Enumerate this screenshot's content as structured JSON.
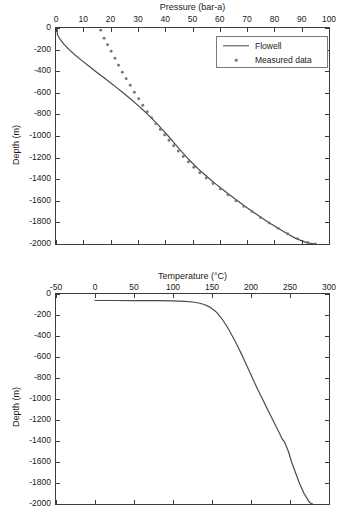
{
  "figure": {
    "width": 344,
    "height": 523,
    "background": "#ffffff",
    "line_color": "#4a4a4a",
    "marker_color": "#777777",
    "axis_color": "#3c3c3c"
  },
  "legend": {
    "entries": [
      {
        "label": "Flowell",
        "style": "line",
        "icon": "line-sample-icon"
      },
      {
        "label": "Measured data",
        "style": "dots",
        "icon": "dot-sample-icon"
      }
    ]
  },
  "chart_data": [
    {
      "id": "pressure-depth",
      "type": "line",
      "title": "Pressure (bar-a)",
      "xlabel": "Pressure (bar-a)",
      "ylabel": "Depth (m)",
      "xlim": [
        0,
        100
      ],
      "ylim": [
        -2000,
        0
      ],
      "xticks": [
        0,
        10,
        20,
        30,
        40,
        50,
        60,
        70,
        80,
        90,
        100
      ],
      "xtick_labels": [
        "0",
        "10",
        "20",
        "30",
        "40",
        "50",
        "60",
        "70",
        "80",
        "90",
        "100"
      ],
      "yticks": [
        0,
        -200,
        -400,
        -600,
        -800,
        -1000,
        -1200,
        -1400,
        -1600,
        -1800,
        -2000
      ],
      "ytick_labels": [
        "0",
        "-200",
        "-400",
        "-600",
        "-800",
        "-1000",
        "-1200",
        "-1400",
        "-1600",
        "-1800",
        "-2000"
      ],
      "x_axis_position": "top",
      "grid": false,
      "legend_position": "top-right",
      "series": [
        {
          "name": "Flowell",
          "style": "line",
          "points": [
            [
              0.4,
              0
            ],
            [
              0.5,
              -60
            ],
            [
              1.4,
              -100
            ],
            [
              2.9,
              -150
            ],
            [
              4.8,
              -200
            ],
            [
              7.0,
              -250
            ],
            [
              9.4,
              -300
            ],
            [
              11.9,
              -350
            ],
            [
              14.4,
              -400
            ],
            [
              17.0,
              -450
            ],
            [
              19.6,
              -500
            ],
            [
              22.1,
              -550
            ],
            [
              24.6,
              -600
            ],
            [
              27.0,
              -650
            ],
            [
              29.3,
              -700
            ],
            [
              31.5,
              -750
            ],
            [
              33.6,
              -800
            ],
            [
              35.6,
              -850
            ],
            [
              37.5,
              -900
            ],
            [
              39.3,
              -950
            ],
            [
              41.1,
              -1000
            ],
            [
              42.8,
              -1050
            ],
            [
              44.5,
              -1100
            ],
            [
              46.2,
              -1150
            ],
            [
              48.0,
              -1200
            ],
            [
              49.9,
              -1250
            ],
            [
              51.9,
              -1300
            ],
            [
              54.1,
              -1350
            ],
            [
              56.4,
              -1400
            ],
            [
              58.8,
              -1450
            ],
            [
              61.3,
              -1500
            ],
            [
              63.9,
              -1550
            ],
            [
              66.5,
              -1600
            ],
            [
              69.2,
              -1650
            ],
            [
              72.0,
              -1700
            ],
            [
              74.9,
              -1750
            ],
            [
              77.9,
              -1800
            ],
            [
              81.1,
              -1850
            ],
            [
              84.4,
              -1900
            ],
            [
              88.0,
              -1950
            ],
            [
              92.0,
              -1990
            ],
            [
              95.0,
              -2000
            ]
          ]
        },
        {
          "name": "Measured data",
          "style": "dots",
          "points": [
            [
              16.4,
              -20
            ],
            [
              17.6,
              -95
            ],
            [
              18.9,
              -155
            ],
            [
              20.2,
              -215
            ],
            [
              21.6,
              -280
            ],
            [
              22.9,
              -345
            ],
            [
              24.3,
              -410
            ],
            [
              25.7,
              -470
            ],
            [
              27.2,
              -530
            ],
            [
              28.7,
              -595
            ],
            [
              30.3,
              -655
            ],
            [
              31.8,
              -715
            ],
            [
              33.4,
              -775
            ],
            [
              35.0,
              -830
            ],
            [
              36.6,
              -885
            ],
            [
              38.2,
              -940
            ],
            [
              39.8,
              -990
            ],
            [
              41.4,
              -1040
            ],
            [
              43.1,
              -1090
            ],
            [
              44.8,
              -1140
            ],
            [
              46.6,
              -1190
            ],
            [
              48.5,
              -1240
            ],
            [
              50.5,
              -1290
            ],
            [
              52.7,
              -1340
            ],
            [
              55.0,
              -1390
            ],
            [
              57.5,
              -1440
            ],
            [
              60.2,
              -1490
            ],
            [
              63.0,
              -1545
            ],
            [
              65.9,
              -1600
            ],
            [
              68.8,
              -1650
            ],
            [
              71.8,
              -1700
            ],
            [
              74.9,
              -1755
            ],
            [
              78.1,
              -1805
            ],
            [
              81.4,
              -1855
            ],
            [
              84.8,
              -1905
            ],
            [
              88.4,
              -1950
            ],
            [
              92.2,
              -1985
            ],
            [
              95.0,
              -2000
            ]
          ]
        }
      ]
    },
    {
      "id": "temperature-depth",
      "type": "line",
      "title": "Temperature (°C)",
      "xlabel": "Temperature (°C)",
      "ylabel": "Depth (m)",
      "xlim": [
        -50,
        300
      ],
      "ylim": [
        -2000,
        0
      ],
      "xticks": [
        -50,
        0,
        50,
        100,
        150,
        200,
        250,
        300
      ],
      "xtick_labels": [
        "-50",
        "0",
        "50",
        "100",
        "150",
        "200",
        "250",
        "300"
      ],
      "yticks": [
        0,
        -200,
        -400,
        -600,
        -800,
        -1000,
        -1200,
        -1400,
        -1600,
        -1800,
        -2000
      ],
      "ytick_labels": [
        "0",
        "-200",
        "-400",
        "-600",
        "-800",
        "-1000",
        "-1200",
        "-1400",
        "-1600",
        "-1800",
        "-2000"
      ],
      "x_axis_position": "top",
      "grid": false,
      "legend_position": "none",
      "series": [
        {
          "name": "Flowell",
          "style": "line",
          "points": [
            [
              0,
              -62
            ],
            [
              20,
              -62
            ],
            [
              50,
              -63
            ],
            [
              80,
              -64
            ],
            [
              100,
              -66
            ],
            [
              115,
              -70
            ],
            [
              125,
              -76
            ],
            [
              133,
              -86
            ],
            [
              140,
              -100
            ],
            [
              146,
              -120
            ],
            [
              151,
              -145
            ],
            [
              156,
              -175
            ],
            [
              160,
              -210
            ],
            [
              164,
              -250
            ],
            [
              168,
              -295
            ],
            [
              172,
              -345
            ],
            [
              176,
              -400
            ],
            [
              180,
              -455
            ],
            [
              184,
              -515
            ],
            [
              188,
              -575
            ],
            [
              192,
              -640
            ],
            [
              196,
              -705
            ],
            [
              200,
              -770
            ],
            [
              204,
              -835
            ],
            [
              208,
              -900
            ],
            [
              212,
              -960
            ],
            [
              216,
              -1020
            ],
            [
              220,
              -1080
            ],
            [
              224,
              -1140
            ],
            [
              228,
              -1200
            ],
            [
              232,
              -1260
            ],
            [
              236,
              -1320
            ],
            [
              240,
              -1380
            ],
            [
              243,
              -1410
            ],
            [
              248,
              -1500
            ],
            [
              252,
              -1600
            ],
            [
              257,
              -1700
            ],
            [
              262,
              -1800
            ],
            [
              268,
              -1900
            ],
            [
              275,
              -1985
            ],
            [
              279,
              -2000
            ]
          ]
        }
      ]
    }
  ]
}
